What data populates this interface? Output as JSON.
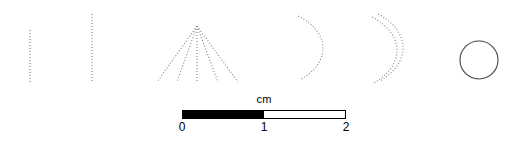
{
  "figure": {
    "background_color": "#ffffff",
    "width": 515,
    "height": 147,
    "stroke_color": "#808080",
    "solid_stroke_color": "#444444"
  },
  "artifacts": [
    {
      "id": "artifact-1",
      "name": "short-dotted-vertical-line",
      "shape": "line",
      "style": "dotted",
      "path": "M 30 30 L 30 82"
    },
    {
      "id": "artifact-2",
      "name": "long-dotted-vertical-line",
      "shape": "line",
      "style": "dotted",
      "path": "M 92 14 L 92 82"
    },
    {
      "id": "artifact-3",
      "name": "dotted-radiating-fan",
      "shape": "fan",
      "style": "dotted",
      "rays": [
        "M 197 26 L 157 82",
        "M 197 26 L 177 82",
        "M 197 26 L 197 82",
        "M 197 26 L 218 82",
        "M 197 26 L 238 82"
      ]
    },
    {
      "id": "artifact-4",
      "name": "dotted-single-arc",
      "shape": "arc",
      "style": "dotted",
      "path": "M 298 16 C 330 32 332 62 300 80"
    },
    {
      "id": "artifact-5",
      "name": "dotted-double-arc",
      "shape": "double-arc",
      "style": "dotted",
      "paths": [
        "M 378 14 C 410 31 412 62 380 81",
        "M 372 17 C 404 34 406 64 374 83"
      ]
    },
    {
      "id": "artifact-6",
      "name": "solid-circle-outline",
      "shape": "circle",
      "style": "solid",
      "cx": 479,
      "cy": 60,
      "r": 19
    }
  ],
  "scale": {
    "unit_label": "cm",
    "segments": [
      {
        "fill": "filled",
        "from": "0",
        "to": "1"
      },
      {
        "fill": "empty",
        "from": "1",
        "to": "2"
      }
    ],
    "ticks": [
      "0",
      "1",
      "2"
    ],
    "tick_0": "0",
    "tick_1": "1",
    "tick_2": "2",
    "bar_color_filled": "#000000",
    "bar_color_empty": "#ffffff",
    "border_color": "#000000"
  }
}
